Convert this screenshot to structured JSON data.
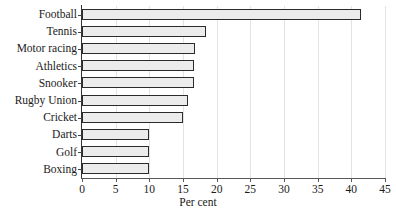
{
  "chart_data": {
    "type": "bar",
    "orientation": "horizontal",
    "title": "",
    "xlabel": "Per cent",
    "ylabel": "",
    "xlim": [
      0,
      45
    ],
    "xticks": [
      0,
      5,
      10,
      15,
      20,
      25,
      30,
      35,
      40,
      45
    ],
    "grid": "vertical",
    "legend": "none",
    "categories": [
      "Football",
      "Tennis",
      "Motor racing",
      "Athletics",
      "Snooker",
      "Rugby Union",
      "Cricket",
      "Darts",
      "Golf",
      "Boxing"
    ],
    "values": [
      41.5,
      18.4,
      16.8,
      16.6,
      16.7,
      15.7,
      15.0,
      10.0,
      10.0,
      10.0
    ]
  },
  "style": {
    "bar_fill": "#ececec",
    "bar_border": "#2b2b2b",
    "axis_color": "#5a5a5a",
    "grid_color": "#e3e3e3",
    "text_color": "#1a1a1a",
    "background": "#ffffff"
  }
}
